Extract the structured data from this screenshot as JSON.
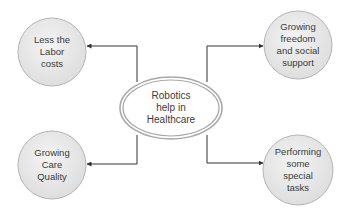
{
  "diagram": {
    "center": {
      "label": "Robotics\nhelp in\nHealthcare"
    },
    "nodes": [
      {
        "id": "top-left",
        "label": "Less the\nLabor\ncosts"
      },
      {
        "id": "top-right",
        "label": "Growing\nfreedom\nand social\nsupport"
      },
      {
        "id": "bottom-left",
        "label": "Growing\nCare\nQuality"
      },
      {
        "id": "bottom-right",
        "label": "Performing\nsome\nspecial\ntasks"
      }
    ],
    "colors": {
      "node_fill": "#e6e6e6",
      "node_stroke": "#b5b5b5",
      "ellipse_stroke": "#a9a9a9",
      "connector": "#333333",
      "text": "#3a3a3a"
    }
  }
}
